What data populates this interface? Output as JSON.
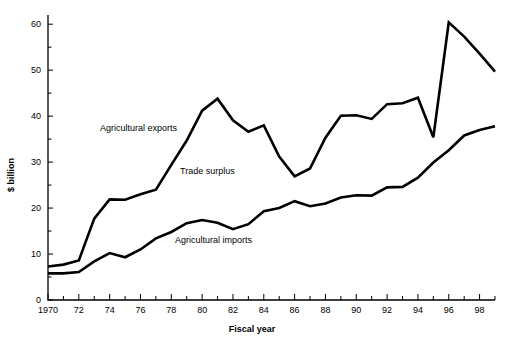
{
  "chart_data": {
    "type": "line",
    "title": "",
    "xlabel": "Fiscal year",
    "ylabel": "$ billion",
    "xlim": [
      1970,
      1999
    ],
    "ylim": [
      0,
      62
    ],
    "grid": false,
    "legend_position": "inline-annotations",
    "x": [
      1970,
      1971,
      1972,
      1973,
      1974,
      1975,
      1976,
      1977,
      1978,
      1979,
      1980,
      1981,
      1982,
      1983,
      1984,
      1985,
      1986,
      1987,
      1988,
      1989,
      1990,
      1991,
      1992,
      1993,
      1994,
      1995,
      1996,
      1997,
      1998,
      1999
    ],
    "xticks": [
      1970,
      1972,
      1974,
      1976,
      1978,
      1980,
      1982,
      1984,
      1986,
      1988,
      1990,
      1992,
      1994,
      1996,
      1998
    ],
    "xticklabels": [
      "1970",
      "72",
      "74",
      "76",
      "78",
      "80",
      "82",
      "84",
      "86",
      "88",
      "90",
      "92",
      "94",
      "96",
      "98"
    ],
    "yticks": [
      0,
      10,
      20,
      30,
      40,
      50,
      60
    ],
    "yticklabels": [
      "0",
      "10",
      "20",
      "30",
      "40",
      "50",
      "60"
    ],
    "series": [
      {
        "name": "Agricultural exports",
        "label": "Agricultural exports",
        "color": "#000000",
        "values": [
          7.3,
          7.7,
          8.6,
          17.7,
          21.9,
          21.8,
          23.0,
          24.0,
          29.4,
          34.7,
          41.2,
          43.8,
          39.1,
          36.6,
          38.0,
          31.2,
          26.9,
          28.6,
          35.3,
          40.1,
          40.2,
          39.4,
          42.6,
          42.8,
          44.0,
          35.4,
          60.4,
          57.3,
          53.6,
          49.7
        ]
      },
      {
        "name": "Agricultural imports",
        "label": "Agricultural imports",
        "color": "#000000",
        "values": [
          5.8,
          5.8,
          6.1,
          8.4,
          10.2,
          9.3,
          11.0,
          13.4,
          14.8,
          16.7,
          17.4,
          16.8,
          15.4,
          16.5,
          19.3,
          20.0,
          21.5,
          20.4,
          21.0,
          22.3,
          22.8,
          22.7,
          24.5,
          24.6,
          26.6,
          29.9,
          32.6,
          35.8,
          37.0,
          37.8
        ]
      }
    ],
    "annotations": [
      {
        "text": "Agricultural exports",
        "x_px": 100,
        "y_px": 131
      },
      {
        "text": "Trade surplus",
        "x_px": 180,
        "y_px": 174
      },
      {
        "text": "Agricultural imports",
        "x_px": 175,
        "y_px": 243
      }
    ]
  }
}
